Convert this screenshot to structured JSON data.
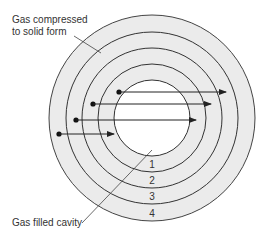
{
  "diagram": {
    "type": "concentric-rings",
    "labels": {
      "top_left_line1": "Gas compressed",
      "top_left_line2": "to solid form",
      "bottom_left": "Gas filled cavity"
    },
    "ring_numbers": [
      "1",
      "2",
      "3",
      "4"
    ],
    "colors": {
      "ring_fill": "#ebebeb",
      "cavity_fill": "#ffffff",
      "stroke": "#333333",
      "text": "#333333"
    },
    "arrows": [
      {
        "from_ring": 1,
        "direction": "right"
      },
      {
        "from_ring": 2,
        "direction": "right"
      },
      {
        "from_ring": 3,
        "direction": "right"
      },
      {
        "from_ring": 4,
        "direction": "right"
      }
    ]
  }
}
